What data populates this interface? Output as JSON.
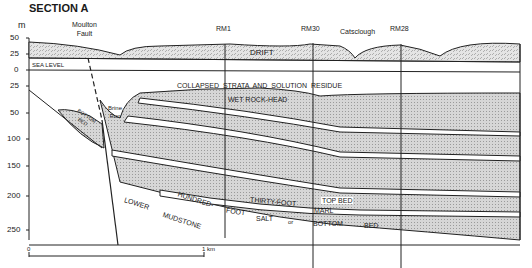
{
  "title": "SECTION A",
  "axis": {
    "unit": "m",
    "ticks": [
      "50",
      "25",
      "0",
      "25",
      "50",
      "100",
      "150",
      "200",
      "250"
    ]
  },
  "labels": {
    "moulton_fault_1": "Moulton",
    "moulton_fault_2": "Fault",
    "rm1": "RM1",
    "rm30": "RM30",
    "catsclough": "Catsclough",
    "rm28": "RM28",
    "drift": "DRIFT",
    "sea_level": "SEA LEVEL",
    "collapsed": "COLLAPSED  STRATA  AND  SOLUTION  RESIDUE",
    "wet_rock_head": "WET ROCK-HEAD",
    "brine_run_1": "Brine",
    "brine_run_2": "Run",
    "bottom_bed_1": "BOTTOM",
    "bottom_bed_2": "BED",
    "top_bed": "TOP BED",
    "thirty_foot": "THIRTY-FOOT",
    "marl": "MARL",
    "hundred": "HUNDRED-",
    "foot": "FOOT",
    "salt": "SALT",
    "or": "or",
    "bottom": "BOTTOM",
    "bed": "BED",
    "lower": "LOWER",
    "mudstone": "MUDSTONE"
  },
  "scale": {
    "start": "0",
    "end": "1 km"
  }
}
